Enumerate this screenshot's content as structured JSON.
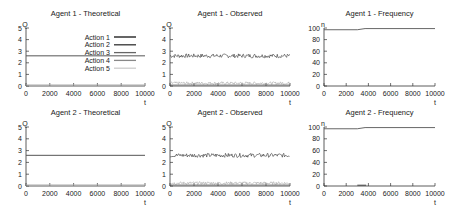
{
  "figure": {
    "panels": [
      {
        "id": "a1-theo",
        "title": "Agent 1 - Theoretical",
        "ylabel": "Q",
        "xlabel": "t"
      },
      {
        "id": "a1-obs",
        "title": "Agent 1 - Observed",
        "ylabel": "Q",
        "xlabel": "t"
      },
      {
        "id": "a1-freq",
        "title": "Agent 1 - Frequency",
        "ylabel": "n",
        "xlabel": "t"
      },
      {
        "id": "a2-theo",
        "title": "Agent 2 - Theoretical",
        "ylabel": "Q",
        "xlabel": "t"
      },
      {
        "id": "a2-obs",
        "title": "Agent 2 - Observed",
        "ylabel": "Q",
        "xlabel": "t"
      },
      {
        "id": "a2-freq",
        "title": "Agent 2 - Frequency",
        "ylabel": "n",
        "xlabel": "t"
      }
    ],
    "legend": [
      "Action 1",
      "Action 2",
      "Action 3",
      "Action 4",
      "Action 5"
    ],
    "q_ticks": [
      "0",
      "1",
      "2",
      "3",
      "4",
      "5"
    ],
    "n_ticks": [
      "0",
      "20",
      "40",
      "60",
      "80",
      "100"
    ],
    "x_ticks": [
      "0",
      "2000",
      "4000",
      "6000",
      "8000",
      "10000"
    ]
  },
  "chart_data": [
    {
      "type": "line",
      "title": "Agent 1 - Theoretical",
      "xlabel": "t",
      "ylabel": "Q",
      "xlim": [
        0,
        10000
      ],
      "ylim": [
        0,
        5
      ],
      "legend_position": "upper right",
      "series": [
        {
          "name": "Action 1",
          "x": [
            0,
            10000
          ],
          "values": [
            2.6,
            2.6
          ]
        },
        {
          "name": "Action 2",
          "x": [
            0,
            10000
          ],
          "values": [
            0,
            0
          ]
        },
        {
          "name": "Action 3",
          "x": [
            0,
            10000
          ],
          "values": [
            0,
            0
          ]
        },
        {
          "name": "Action 4",
          "x": [
            0,
            10000
          ],
          "values": [
            0,
            0
          ]
        },
        {
          "name": "Action 5",
          "x": [
            0,
            10000
          ],
          "values": [
            0,
            0
          ]
        }
      ]
    },
    {
      "type": "line",
      "title": "Agent 1 - Observed",
      "xlabel": "t",
      "ylabel": "Q",
      "xlim": [
        0,
        10000
      ],
      "ylim": [
        0,
        5
      ],
      "series": [
        {
          "name": "Action 1",
          "x": [
            0,
            10000
          ],
          "values": [
            2.6,
            2.6
          ],
          "note": "noisy around 2.6 (±0.15)"
        },
        {
          "name": "Actions 2-5",
          "x": [
            0,
            10000
          ],
          "values": [
            0.1,
            0.1
          ],
          "note": "noisy near 0-0.3"
        }
      ]
    },
    {
      "type": "line",
      "title": "Agent 1 - Frequency",
      "xlabel": "t",
      "ylabel": "n",
      "xlim": [
        0,
        10000
      ],
      "ylim": [
        0,
        100
      ],
      "series": [
        {
          "name": "Action 1",
          "x": [
            0,
            3000,
            3700,
            10000
          ],
          "values": [
            97,
            97,
            99,
            99
          ]
        }
      ]
    },
    {
      "type": "line",
      "title": "Agent 2 - Theoretical",
      "xlabel": "t",
      "ylabel": "Q",
      "xlim": [
        0,
        10000
      ],
      "ylim": [
        0,
        5
      ],
      "series": [
        {
          "name": "Action 1",
          "x": [
            0,
            10000
          ],
          "values": [
            2.6,
            2.6
          ]
        },
        {
          "name": "Actions 2-5",
          "x": [
            0,
            10000
          ],
          "values": [
            0,
            0
          ]
        }
      ]
    },
    {
      "type": "line",
      "title": "Agent 2 - Observed",
      "xlabel": "t",
      "ylabel": "Q",
      "xlim": [
        0,
        10000
      ],
      "ylim": [
        0,
        5
      ],
      "series": [
        {
          "name": "Action 1",
          "x": [
            0,
            10000
          ],
          "values": [
            2.6,
            2.6
          ],
          "note": "noisy around 2.6 (±0.15)"
        },
        {
          "name": "Actions 2-5",
          "x": [
            0,
            10000
          ],
          "values": [
            0.1,
            0.1
          ],
          "note": "noisy near 0-0.3"
        }
      ]
    },
    {
      "type": "line",
      "title": "Agent 2 - Frequency",
      "xlabel": "t",
      "ylabel": "n",
      "xlim": [
        0,
        10000
      ],
      "ylim": [
        0,
        100
      ],
      "series": [
        {
          "name": "Action 1",
          "x": [
            0,
            3000,
            3700,
            10000
          ],
          "values": [
            97,
            97,
            99,
            99
          ]
        }
      ]
    }
  ]
}
